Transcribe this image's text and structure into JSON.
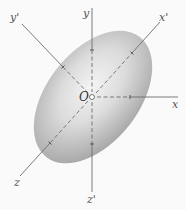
{
  "figure": {
    "title": "",
    "origin": {
      "label": "O",
      "x": 92,
      "y": 97
    },
    "labels": {
      "x": "x",
      "y": "y",
      "z": "z",
      "x_prime": "x'",
      "y_prime": "y'",
      "z_prime": "z'",
      "origin": "O"
    },
    "ellipsoid": {
      "center": [
        93,
        97
      ],
      "semi_major": 76,
      "semi_minor": 46,
      "rotation_deg": -48,
      "fill_light": "#f2f2f2",
      "fill_dark": "#a9a9a9"
    },
    "axes": [
      {
        "name": "y",
        "from": [
          92,
          97
        ],
        "to": [
          92,
          8
        ],
        "style": "solid-outside-dashed-inside"
      },
      {
        "name": "x",
        "from": [
          92,
          97
        ],
        "to": [
          178,
          97
        ],
        "style": "solid-outside-dashed-inside"
      },
      {
        "name": "z",
        "from": [
          92,
          97
        ],
        "to": [
          20,
          176
        ],
        "style": "solid-outside-dashed-inside"
      },
      {
        "name": "x'",
        "from": [
          92,
          97
        ],
        "to": [
          160,
          22
        ],
        "style": "solid-outside-dashed-inside"
      },
      {
        "name": "y'",
        "from": [
          92,
          97
        ],
        "to": [
          22,
          24
        ],
        "style": "solid-outside-dashed-inside"
      },
      {
        "name": "z'",
        "from": [
          92,
          97
        ],
        "to": [
          92,
          192
        ],
        "style": "solid-outside-dashed-inside"
      }
    ],
    "colors": {
      "background": "#fafafa",
      "axis": "#6b6b6b",
      "label": "#555555"
    }
  }
}
